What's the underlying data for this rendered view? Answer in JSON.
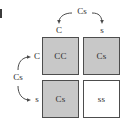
{
  "diagram": {
    "top_parent": {
      "genotype": "Cs",
      "gametes": [
        "C",
        "s"
      ]
    },
    "left_parent": {
      "genotype": "Cs",
      "gametes": [
        "C",
        "s"
      ]
    },
    "column_headers": [
      "C",
      "s"
    ],
    "row_headers": [
      "C",
      "s"
    ],
    "cells": [
      {
        "genotype": "CC",
        "shaded": true
      },
      {
        "genotype": "Cs",
        "shaded": true
      },
      {
        "genotype": "Cs",
        "shaded": true
      },
      {
        "genotype": "ss",
        "shaded": false
      }
    ],
    "colors": {
      "shaded_fill": "#c8c8c8",
      "plain_fill": "#ffffff",
      "border": "#4d4d4d",
      "text": "#2b2b2b",
      "arc": "#4a4a4a"
    }
  }
}
